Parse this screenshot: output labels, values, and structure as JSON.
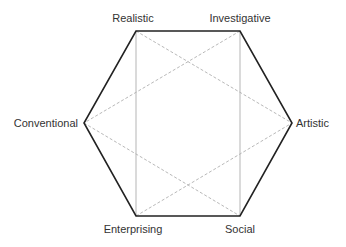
{
  "diagram": {
    "type": "hexagon",
    "colors": {
      "outline": "#222222",
      "inner_solid": "#b5b5b5",
      "inner_dashed": "#b0b0b0",
      "label": "#333333",
      "background": "#ffffff"
    },
    "vertices": [
      {
        "id": "realistic",
        "label": "Realistic",
        "x": 136,
        "y": 31
      },
      {
        "id": "investigative",
        "label": "Investigative",
        "x": 240,
        "y": 31
      },
      {
        "id": "artistic",
        "label": "Artistic",
        "x": 292,
        "y": 123
      },
      {
        "id": "social",
        "label": "Social",
        "x": 240,
        "y": 216
      },
      {
        "id": "enterprising",
        "label": "Enterprising",
        "x": 136,
        "y": 216
      },
      {
        "id": "conventional",
        "label": "Conventional",
        "x": 84,
        "y": 123
      }
    ],
    "labels": {
      "realistic": "Realistic",
      "investigative": "Investigative",
      "artistic": "Artistic",
      "social": "Social",
      "enterprising": "Enterprising",
      "conventional": "Conventional"
    },
    "edges": {
      "outline": [
        [
          "realistic",
          "investigative"
        ],
        [
          "investigative",
          "artistic"
        ],
        [
          "artistic",
          "social"
        ],
        [
          "social",
          "enterprising"
        ],
        [
          "enterprising",
          "conventional"
        ],
        [
          "conventional",
          "realistic"
        ]
      ],
      "inner_solid": [
        [
          "realistic",
          "enterprising"
        ],
        [
          "investigative",
          "social"
        ]
      ],
      "inner_dashed": [
        [
          "realistic",
          "artistic"
        ],
        [
          "investigative",
          "conventional"
        ],
        [
          "conventional",
          "social"
        ],
        [
          "enterprising",
          "artistic"
        ]
      ]
    }
  }
}
